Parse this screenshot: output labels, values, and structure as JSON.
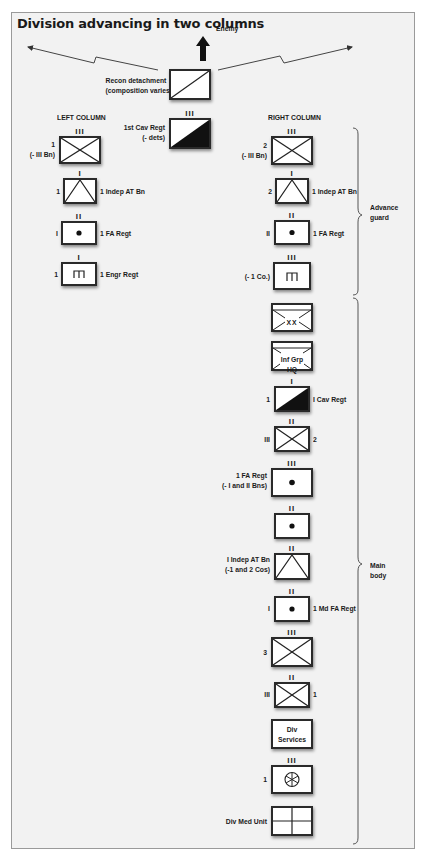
{
  "title": "Division advancing in two columns",
  "enemy_label": "Enemy",
  "recon": {
    "label_line1": "Recon detachment",
    "label_line2": "(composition varies)"
  },
  "cav_regt_top": {
    "echelon": "III",
    "label_line1": "1st Cav Regt",
    "label_line2": "(- dets)"
  },
  "left_column": {
    "header": "LEFT COLUMN",
    "units": [
      {
        "echelon": "III",
        "symbol": "infantry",
        "left_line1": "1",
        "left_line2": "(- III Bn)",
        "right": ""
      },
      {
        "echelon": "I",
        "symbol": "anti-tank",
        "left_line1": "1",
        "right": "1 Indep AT Bn"
      },
      {
        "echelon": "II",
        "symbol": "artillery",
        "left_line1": "I",
        "right": "1 FA Regt"
      },
      {
        "echelon": "I",
        "symbol": "engineer",
        "left_line1": "1",
        "right": "1 Engr Regt"
      }
    ]
  },
  "right_column": {
    "header": "RIGHT COLUMN",
    "units": [
      {
        "echelon": "III",
        "symbol": "infantry",
        "left_line1": "2",
        "left_line2": "(- III Bn)",
        "right": ""
      },
      {
        "echelon": "I",
        "symbol": "anti-tank",
        "left_line1": "2",
        "right": "1 Indep AT Bn"
      },
      {
        "echelon": "II",
        "symbol": "artillery",
        "left_line1": "II",
        "right": "1 FA Regt"
      },
      {
        "echelon": "III",
        "symbol": "engineer",
        "left_line1": "(- 1 Co.)",
        "right": ""
      },
      {
        "echelon": "",
        "symbol": "division-hq",
        "inner": "XX"
      },
      {
        "echelon": "",
        "symbol": "group-hq",
        "inner": "Inf Grp HQ"
      },
      {
        "echelon": "I",
        "symbol": "cavalry",
        "left_line1": "1",
        "right": "I Cav Regt"
      },
      {
        "echelon": "II",
        "symbol": "infantry",
        "left_line1": "III",
        "right": "2"
      },
      {
        "echelon": "III",
        "symbol": "artillery",
        "left_line1": "1 FA Regt",
        "left_line2": "(- I and II Bns)",
        "right": ""
      },
      {
        "echelon": "II",
        "symbol": "artillery",
        "right": ""
      },
      {
        "echelon": "II",
        "symbol": "anti-tank",
        "left_line1": "I Indep AT Bn",
        "left_line2": "(-1 and 2 Cos)",
        "right": ""
      },
      {
        "echelon": "II",
        "symbol": "artillery",
        "left_line1": "I",
        "right": "1 Md FA Regt"
      },
      {
        "echelon": "III",
        "symbol": "infantry",
        "left_line1": "3",
        "right": ""
      },
      {
        "echelon": "II",
        "symbol": "infantry",
        "left_line1": "III",
        "right": "1"
      },
      {
        "echelon": "",
        "symbol": "services",
        "inner_line1": "Div",
        "inner_line2": "Services"
      },
      {
        "echelon": "III",
        "symbol": "transport",
        "left_line1": "1",
        "right": ""
      },
      {
        "echelon": "",
        "symbol": "medical",
        "left_line1": "Div Med Unit",
        "right": ""
      }
    ]
  },
  "groups": {
    "advance_guard": {
      "line1": "Advance",
      "line2": "guard"
    },
    "main_body": {
      "line1": "Main",
      "line2": "body"
    }
  }
}
